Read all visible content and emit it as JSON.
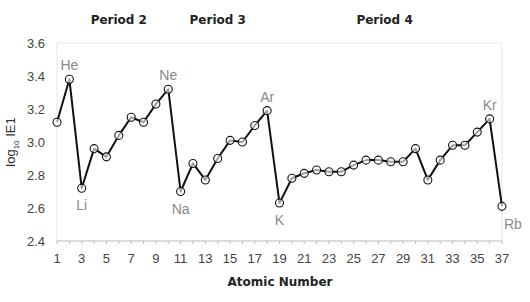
{
  "chart_data": {
    "type": "line",
    "title": "",
    "xlabel": "Atomic Number",
    "ylabel": "log10 IE1",
    "ylabel_main": "log",
    "ylabel_sub": "10",
    "ylabel_rest": " IE1",
    "xlim": [
      1,
      37
    ],
    "ylim": [
      2.4,
      3.6
    ],
    "grid": false,
    "legend": null,
    "x_ticks": [
      1,
      3,
      5,
      7,
      9,
      11,
      13,
      15,
      17,
      19,
      21,
      23,
      25,
      27,
      29,
      31,
      33,
      35,
      37
    ],
    "y_ticks": [
      "2.4",
      "2.6",
      "2.8",
      "3.0",
      "3.2",
      "3.4",
      "3.6"
    ],
    "period_labels": [
      {
        "label": "Period 2",
        "x_center": 6
      },
      {
        "label": "Period 3",
        "x_center": 14
      },
      {
        "label": "Period 4",
        "x_center": 27.5
      }
    ],
    "annotations": [
      {
        "text": "He",
        "x": 2,
        "pos": "above"
      },
      {
        "text": "Li",
        "x": 3,
        "pos": "below"
      },
      {
        "text": "Ne",
        "x": 10,
        "pos": "above"
      },
      {
        "text": "Na",
        "x": 11,
        "pos": "below"
      },
      {
        "text": "Ar",
        "x": 18,
        "pos": "above"
      },
      {
        "text": "K",
        "x": 19,
        "pos": "below"
      },
      {
        "text": "Kr",
        "x": 36,
        "pos": "above"
      },
      {
        "text": "Rb",
        "x": 37,
        "pos": "below-right"
      }
    ],
    "series": [
      {
        "name": "log10 IE1",
        "x": [
          1,
          2,
          3,
          4,
          5,
          6,
          7,
          8,
          9,
          10,
          11,
          12,
          13,
          14,
          15,
          16,
          17,
          18,
          19,
          20,
          21,
          22,
          23,
          24,
          25,
          26,
          27,
          28,
          29,
          30,
          31,
          32,
          33,
          34,
          35,
          36,
          37
        ],
        "values": [
          3.12,
          3.38,
          2.72,
          2.96,
          2.91,
          3.04,
          3.15,
          3.12,
          3.23,
          3.32,
          2.7,
          2.87,
          2.77,
          2.9,
          3.01,
          3.0,
          3.1,
          3.19,
          2.63,
          2.78,
          2.81,
          2.83,
          2.82,
          2.82,
          2.86,
          2.89,
          2.89,
          2.88,
          2.88,
          2.96,
          2.77,
          2.89,
          2.98,
          2.98,
          3.06,
          3.14,
          2.61
        ]
      }
    ]
  },
  "colors": {
    "line": "#111111",
    "marker_stroke": "#111111",
    "annotation": "#8a8a8a",
    "axis": "#bbbbbb",
    "frame": "#e6e6e6",
    "tick_label": "#444444"
  }
}
